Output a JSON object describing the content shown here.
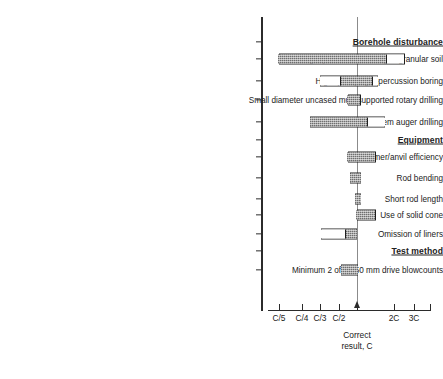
{
  "chart_data": {
    "type": "bar",
    "title": "",
    "xlabel": "Correct result, C",
    "ylabel": "",
    "orientation": "horizontal",
    "axis_note": "Logarithmic-style ratio axis of measured SPT N-value relative to the correct result C",
    "tick_labels": [
      "C/5",
      "C/4",
      "C/3",
      "C/2",
      "C",
      "2C",
      "3C"
    ],
    "tick_positions_px": [
      279,
      302,
      320,
      339,
      357,
      394,
      414
    ],
    "reference_line": {
      "label": "C",
      "caption_line1": "Correct",
      "caption_line2": "result, C",
      "x_px": 357
    },
    "groups": [
      {
        "heading": "Borehole disturbance",
        "items": [
          {
            "label": "Light percussion boring in granular soil",
            "range_low": "C/5",
            "range_high": "3C",
            "shaded_from": "C/5",
            "shaded_to": "2C"
          },
          {
            "label": "High quality light-percussion boring",
            "range_low": "C/2",
            "range_high": "1.6C",
            "shaded_from": "C/1.5",
            "shaded_to": "1.4C"
          },
          {
            "label": "Small diameter uncased mud-supported rotary drilling",
            "range_low": "C/1.2",
            "range_high": "1.1C",
            "shaded_from": "C/1.2",
            "shaded_to": "1.1C"
          },
          {
            "label": "Hollow stem auger drilling",
            "range_low": "C/3",
            "range_high": "2C",
            "shaded_from": "C/3",
            "shaded_to": "1.3C"
          }
        ]
      },
      {
        "heading": "Equipment",
        "items": [
          {
            "label": "Hammer/anvil efficiency",
            "range_low": "C/1.2",
            "range_high": "1.5C",
            "shaded_from": "C/1.2",
            "shaded_to": "1.5C"
          },
          {
            "label": "Rod bending",
            "range_low": "C/1.1",
            "range_high": "1.1C",
            "shaded_from": "C/1.1",
            "shaded_to": "1.1C"
          },
          {
            "label": "Short rod length",
            "range_low": "C",
            "range_high": "1.1C",
            "shaded_from": "C",
            "shaded_to": "1.1C"
          },
          {
            "label": "Use of solid cone",
            "range_low": "C",
            "range_high": "1.5C",
            "shaded_from": "C",
            "shaded_to": "1.5C"
          },
          {
            "label": "Omission of liners",
            "range_low": "C/2.8",
            "range_high": "C",
            "shaded_from": "C/1.4",
            "shaded_to": "C"
          }
        ]
      },
      {
        "heading": "Test method",
        "items": [
          {
            "label": "Minimum 2 of 3 150 mm drive blowcounts",
            "range_low": "C/1.7",
            "range_high": "C",
            "shaded_from": "C/1.7",
            "shaded_to": "C"
          }
        ]
      }
    ]
  },
  "rows": [
    {
      "kind": "heading",
      "text": "Borehole disturbance",
      "y": 42
    },
    {
      "kind": "bar",
      "text": "Light percussion boring in granular soil",
      "y": 59,
      "segments": [
        {
          "style": "shaded",
          "x": 278.5,
          "w": 108
        },
        {
          "style": "white",
          "x": 386.5,
          "w": 18
        }
      ]
    },
    {
      "kind": "bar",
      "text": "High quality light-percussion boring",
      "y": 81,
      "segments": [
        {
          "style": "white",
          "x": 320,
          "w": 20
        },
        {
          "style": "shaded",
          "x": 340,
          "w": 32
        },
        {
          "style": "white",
          "x": 372,
          "w": 6
        }
      ]
    },
    {
      "kind": "bar",
      "text": "Small diameter uncased mud-supported rotary drilling",
      "y": 100,
      "segments": [
        {
          "style": "shaded",
          "x": 347.5,
          "w": 13
        }
      ]
    },
    {
      "kind": "bar",
      "text": "Hollow stem auger drilling",
      "y": 122,
      "segments": [
        {
          "style": "shaded",
          "x": 310,
          "w": 57
        },
        {
          "style": "white",
          "x": 367,
          "w": 18
        }
      ]
    },
    {
      "kind": "heading",
      "text": "Equipment",
      "y": 140
    },
    {
      "kind": "bar",
      "text": "Hammer/anvil efficiency",
      "y": 157,
      "segments": [
        {
          "style": "shaded",
          "x": 347.5,
          "w": 28
        }
      ]
    },
    {
      "kind": "bar",
      "text": "Rod bending",
      "y": 178,
      "segments": [
        {
          "style": "shaded",
          "x": 350,
          "w": 11
        }
      ]
    },
    {
      "kind": "bar",
      "text": "Short rod length",
      "y": 199,
      "segments": [
        {
          "style": "shaded",
          "x": 355,
          "w": 6
        }
      ]
    },
    {
      "kind": "bar",
      "text": "Use of solid cone",
      "y": 215,
      "segments": [
        {
          "style": "shaded",
          "x": 356.5,
          "w": 19
        }
      ]
    },
    {
      "kind": "bar",
      "text": "Omission of liners",
      "y": 234,
      "segments": [
        {
          "style": "white",
          "x": 321,
          "w": 24
        },
        {
          "style": "shaded",
          "x": 345,
          "w": 12
        }
      ]
    },
    {
      "kind": "heading",
      "text": "Test method",
      "y": 251
    },
    {
      "kind": "bar",
      "text": "Minimum 2 of 3 150 mm drive blowcounts",
      "y": 270,
      "segments": [
        {
          "style": "shaded",
          "x": 341,
          "w": 17
        }
      ]
    }
  ],
  "axis": {
    "ticks": [
      {
        "label": "C/5",
        "x": 279
      },
      {
        "label": "C/4",
        "x": 302
      },
      {
        "label": "C/3",
        "x": 320
      },
      {
        "label": "C/2",
        "x": 339
      },
      {
        "label": "",
        "x": 357
      },
      {
        "label": "2C",
        "x": 394
      },
      {
        "label": "3C",
        "x": 414
      },
      {
        "label": "",
        "x": 430
      }
    ],
    "reference_caption_line1": "Correct",
    "reference_caption_line2": "result, C",
    "reference_x": 357
  }
}
